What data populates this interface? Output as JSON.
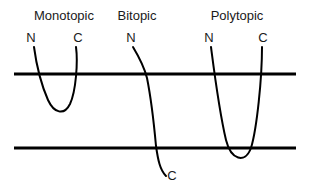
{
  "figure": {
    "kind": "membrane-protein-topology-diagram",
    "background_color": "#ffffff",
    "stroke_color": "#000000",
    "text_color": "#1a1a1a",
    "width": 309,
    "height": 191
  },
  "membrane": {
    "label": "lipid-bilayer",
    "line_color": "#000000",
    "line_thickness": 3,
    "x_start": 14,
    "x_end": 296,
    "upper_line_y": 74,
    "lower_line_y": 148
  },
  "panels": [
    {
      "id": "monotopic",
      "title": "Monotopic",
      "title_x": 64,
      "title_y": 20,
      "n_label": "N",
      "n_x": 31,
      "n_y": 42,
      "c_label": "C",
      "c_x": 78,
      "c_y": 42,
      "description": "Chain dips into the outer leaflet as a shallow U and returns; it does not cross the inner membrane line.",
      "path": "M 34 47 C 36 62, 41 84, 48 100 C 54 113, 64 116, 70 104 C 76 91, 78 62, 76 47"
    },
    {
      "id": "bitopic",
      "title": "Bitopic",
      "title_x": 137,
      "title_y": 20,
      "n_label": "N",
      "n_x": 131,
      "n_y": 42,
      "c_label": "C",
      "c_x": 172,
      "c_y": 180,
      "description": "Single chain passes once through the bilayer, entering above the upper line and exiting below the lower line.",
      "path": "M 133 47 C 139 57, 144 66, 147 78 C 151 98, 154 124, 156 146 C 158 160, 160 170, 166 176"
    },
    {
      "id": "polytopic",
      "title": "Polytopic",
      "title_x": 237,
      "title_y": 20,
      "n_label": "N",
      "n_x": 209,
      "n_y": 42,
      "c_label": "C",
      "c_x": 263,
      "c_y": 42,
      "description": "Chain spans the full bilayer as a deep U, looping below the lower membrane line before returning to the outside.",
      "path": "M 211 47 C 214 70, 219 110, 226 140 C 231 160, 245 164, 251 148 C 257 128, 262 78, 262 47"
    }
  ],
  "icons": {
    "n_terminus": "n-terminus-label",
    "c_terminus": "c-terminus-label"
  }
}
